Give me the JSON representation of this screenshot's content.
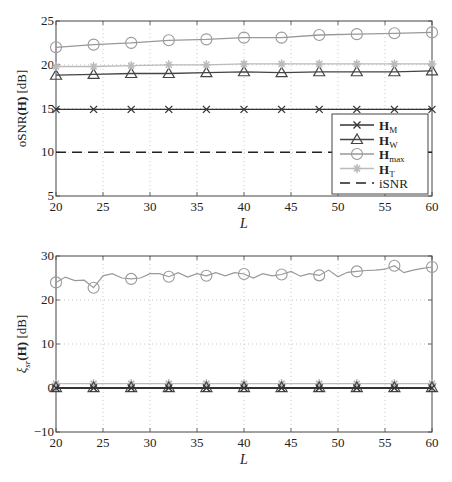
{
  "chart_data": [
    {
      "type": "line",
      "title": "",
      "xlabel": "L",
      "ylabel": "oSNR(H) [dB]",
      "xlim": [
        20,
        60
      ],
      "ylim": [
        5,
        25
      ],
      "xticks": [
        20,
        25,
        30,
        35,
        40,
        45,
        50,
        55,
        60
      ],
      "yticks": [
        5,
        10,
        15,
        20,
        25
      ],
      "grid": true,
      "legend_position": "lower right",
      "x": [
        20,
        24,
        28,
        32,
        36,
        40,
        44,
        48,
        52,
        56,
        60
      ],
      "series": [
        {
          "name": "H_M",
          "label_main": "H",
          "label_sub": "M",
          "marker": "x",
          "color": "#333333",
          "dash": "",
          "values": [
            14.9,
            14.9,
            14.9,
            14.9,
            14.9,
            14.9,
            14.9,
            14.9,
            14.9,
            14.9,
            14.9
          ]
        },
        {
          "name": "H_W",
          "label_main": "H",
          "label_sub": "W",
          "marker": "triangle",
          "color": "#444444",
          "dash": "",
          "values": [
            18.8,
            18.9,
            19.0,
            19.0,
            19.1,
            19.2,
            19.1,
            19.2,
            19.2,
            19.2,
            19.3
          ]
        },
        {
          "name": "H_max",
          "label_main": "H",
          "label_sub": "max",
          "marker": "circle",
          "color": "#999999",
          "dash": "",
          "values": [
            22.0,
            22.3,
            22.5,
            22.8,
            22.9,
            23.1,
            23.1,
            23.4,
            23.5,
            23.6,
            23.7
          ]
        },
        {
          "name": "H_T",
          "label_main": "H",
          "label_sub": "T",
          "marker": "star",
          "color": "#bbbbbb",
          "dash": "",
          "values": [
            19.8,
            19.8,
            19.9,
            20.0,
            20.0,
            20.1,
            20.1,
            20.1,
            20.1,
            20.1,
            20.1
          ]
        },
        {
          "name": "iSNR",
          "label_main": "iSNR",
          "label_sub": "",
          "marker": "none",
          "color": "#222222",
          "dash": "10,6",
          "values": [
            10,
            10,
            10,
            10,
            10,
            10,
            10,
            10,
            10,
            10,
            10
          ]
        }
      ]
    },
    {
      "type": "line",
      "title": "",
      "xlabel": "L",
      "ylabel": "ξsr(H) [dB]",
      "xlim": [
        20,
        60
      ],
      "ylim": [
        -10,
        30
      ],
      "xticks": [
        20,
        25,
        30,
        35,
        40,
        45,
        50,
        55,
        60
      ],
      "yticks": [
        -10,
        0,
        10,
        20,
        30
      ],
      "grid": true,
      "x": [
        20,
        21,
        22,
        23,
        24,
        25,
        26,
        27,
        28,
        29,
        30,
        31,
        32,
        33,
        34,
        35,
        36,
        37,
        38,
        39,
        40,
        41,
        42,
        43,
        44,
        45,
        46,
        47,
        48,
        49,
        50,
        51,
        52,
        53,
        54,
        55,
        56,
        57,
        58,
        59,
        60
      ],
      "marker_x": [
        20,
        24,
        28,
        32,
        36,
        40,
        44,
        48,
        52,
        56,
        60
      ],
      "series": [
        {
          "name": "H_M",
          "marker": "x",
          "color": "#333333",
          "values_at_markers": [
            0,
            0,
            0,
            0,
            0,
            0,
            0,
            0,
            0,
            0,
            0
          ]
        },
        {
          "name": "H_W",
          "marker": "triangle",
          "color": "#444444",
          "values_at_markers": [
            0.1,
            0.1,
            0.1,
            0.1,
            0.1,
            0.1,
            0.1,
            0.1,
            0.1,
            0.1,
            0.1
          ]
        },
        {
          "name": "H_max",
          "marker": "circle",
          "color": "#999999",
          "values": [
            24.0,
            25.2,
            24.4,
            24.5,
            22.8,
            25.5,
            26.0,
            25.0,
            24.8,
            25.0,
            26.0,
            26.0,
            25.3,
            26.2,
            25.2,
            26.0,
            25.5,
            26.2,
            25.5,
            26.2,
            25.9,
            25.0,
            26.0,
            25.5,
            25.8,
            26.5,
            25.4,
            26.0,
            25.6,
            26.8,
            25.3,
            26.3,
            26.5,
            26.7,
            26.8,
            27.0,
            27.8,
            26.2,
            26.8,
            27.2,
            27.5
          ]
        },
        {
          "name": "H_T",
          "marker": "star",
          "color": "#bbbbbb",
          "values_at_markers": [
            1.0,
            1.0,
            1.0,
            1.0,
            1.0,
            1.0,
            1.0,
            1.0,
            1.0,
            1.0,
            1.0
          ]
        }
      ]
    }
  ],
  "legend": {
    "items": [
      {
        "main": "H",
        "sub": "M"
      },
      {
        "main": "H",
        "sub": "W"
      },
      {
        "main": "H",
        "sub": "max"
      },
      {
        "main": "H",
        "sub": "T"
      },
      {
        "main": "iSNR",
        "sub": ""
      }
    ]
  },
  "top": {
    "ylabel_pre": "oSNR",
    "ylabel_arg": "(H)",
    "ylabel_unit": "[dB]",
    "xlabel": "L"
  },
  "bottom": {
    "ylabel_pre": "ξ",
    "ylabel_sub": "sr",
    "ylabel_arg": "(H)",
    "ylabel_unit": "[dB]",
    "xlabel": "L"
  }
}
